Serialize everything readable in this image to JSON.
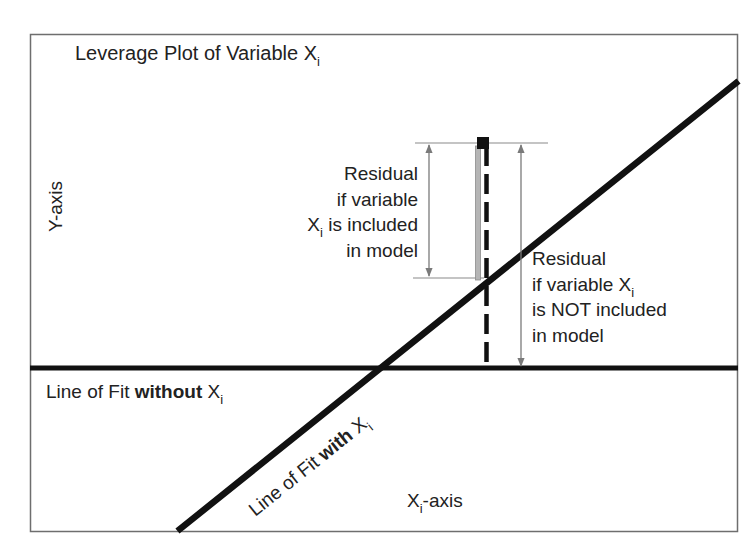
{
  "diagram": {
    "title": {
      "text": "Leverage Plot of Variable X",
      "subscript": "i"
    },
    "y_axis_label": "Y-axis",
    "x_axis_label": {
      "text": "X",
      "subscript": "i",
      "suffix": "-axis"
    },
    "residual_included": {
      "line1": "Residual",
      "line2": "if variable",
      "line3_prefix": "X",
      "line3_subscript": "i",
      "line3_suffix": " is included",
      "line4": "in model"
    },
    "residual_not_included": {
      "line1": "Residual",
      "line2_prefix": "if variable X",
      "line2_subscript": "i",
      "line3": "is NOT included",
      "line4": "in model"
    },
    "line_without": {
      "prefix": "Line of Fit ",
      "bold": "without",
      "var": " X",
      "subscript": "i"
    },
    "line_with": {
      "prefix": "Line of Fit ",
      "bold": "with",
      "var": " X",
      "subscript": "i"
    },
    "colors": {
      "frame": "#6e6e6e",
      "fit_lines": "#111111",
      "arrows": "#7a7a7a",
      "residual_bar": "#b5b5b5",
      "point": "#111111",
      "background": "#ffffff"
    }
  }
}
